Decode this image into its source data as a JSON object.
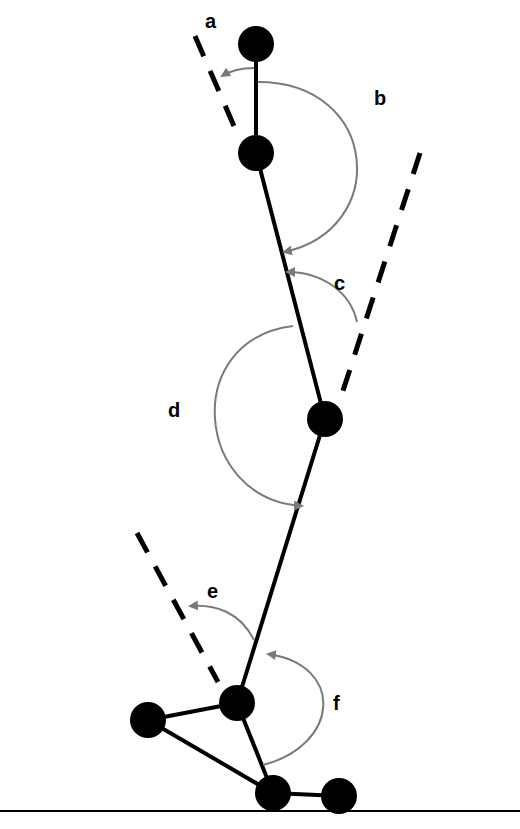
{
  "diagram": {
    "title": "",
    "labels": {
      "a": "a",
      "b": "b",
      "c": "c",
      "d": "d",
      "e": "e",
      "f": "f"
    },
    "colors": {
      "segment": "#000000",
      "arc": "#7a7a7a",
      "background": "#ffffff"
    },
    "joints": [
      {
        "name": "head",
        "x": 256,
        "y": 44
      },
      {
        "name": "neck",
        "x": 256,
        "y": 153
      },
      {
        "name": "hip",
        "x": 325,
        "y": 419
      },
      {
        "name": "ankle",
        "x": 237,
        "y": 703
      },
      {
        "name": "heel",
        "x": 148,
        "y": 720
      },
      {
        "name": "metatarsal",
        "x": 273,
        "y": 793
      },
      {
        "name": "toe",
        "x": 339,
        "y": 796
      }
    ]
  }
}
